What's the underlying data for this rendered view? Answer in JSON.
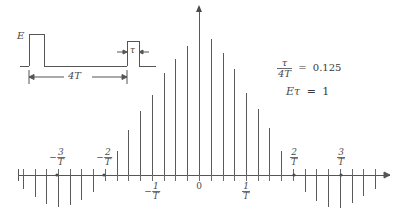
{
  "figure": {
    "axis_color": "#555555",
    "line_color": "#5a5a5a",
    "text_color": "#4a4a4a"
  },
  "pulse_diagram": {
    "amplitude_label": "E",
    "width_label": "τ",
    "period_label": "4T",
    "baseline_y": 66,
    "top_y": 34
  },
  "annotations": {
    "ratio": {
      "numerator": "τ",
      "denominator": "4T",
      "equals": "=",
      "value": "0.125"
    },
    "area": {
      "expr": "Eτ",
      "equals": "=",
      "value": "1"
    }
  },
  "axis": {
    "y": 175,
    "x_start": 18,
    "x_end": 392,
    "zero_x": 199,
    "line_spacing": 11.7,
    "tick_up": 6,
    "tick_down": 6,
    "labels": [
      {
        "text": "-3/T",
        "sign": "−",
        "num": "3",
        "den": "T",
        "x": 57,
        "y": 148,
        "marker": true
      },
      {
        "text": "-2/T",
        "sign": "−",
        "num": "2",
        "den": "T",
        "x": 104,
        "y": 148,
        "marker": true
      },
      {
        "text": "-1/T",
        "sign": "−",
        "num": "1",
        "den": "T",
        "x": 152,
        "y": 182,
        "marker": false
      },
      {
        "text": "0",
        "sign": "",
        "num": "0",
        "den": "",
        "x": 199,
        "y": 182,
        "marker": false
      },
      {
        "text": "1/T",
        "sign": "",
        "num": "1",
        "den": "T",
        "x": 246,
        "y": 182,
        "marker": false
      },
      {
        "text": "2/T",
        "sign": "",
        "num": "2",
        "den": "T",
        "x": 294,
        "y": 148,
        "marker": true
      },
      {
        "text": "3/T",
        "sign": "",
        "num": "3",
        "den": "T",
        "x": 341,
        "y": 148,
        "marker": true
      }
    ]
  },
  "chart_data": {
    "type": "line-spectrum",
    "xlabel": "frequency",
    "ylabel": "amplitude",
    "envelope": "sinc",
    "duty_cycle": 0.125,
    "pulse_area": 1,
    "harmonic_spacing": "1/(4T)",
    "xlim": [
      -4.2,
      4.2
    ],
    "ylim": [
      -0.28,
      1.05
    ],
    "x_unit": "1/T",
    "grid": false,
    "legend": false,
    "x": [
      -3.75,
      -3.5,
      -3.25,
      -3.0,
      -2.75,
      -2.5,
      -2.25,
      -2.0,
      -1.75,
      -1.5,
      -1.25,
      -1.0,
      -0.75,
      -0.5,
      -0.25,
      0,
      0.25,
      0.5,
      0.75,
      1.0,
      1.25,
      1.5,
      1.75,
      2.0,
      2.25,
      2.5,
      2.75,
      3.0,
      3.25,
      3.5,
      3.75
    ],
    "values": [
      -0.085,
      -0.13,
      -0.17,
      -0.185,
      -0.175,
      -0.145,
      -0.1,
      0.0,
      0.135,
      0.26,
      0.375,
      0.47,
      0.6,
      0.68,
      0.76,
      1.0,
      0.8,
      0.715,
      0.62,
      0.48,
      0.385,
      0.275,
      0.14,
      0.0,
      -0.1,
      -0.15,
      -0.185,
      -0.19,
      -0.165,
      -0.125,
      -0.085
    ],
    "series": [
      {
        "name": "harmonic amplitudes",
        "values": [
          -0.085,
          -0.13,
          -0.17,
          -0.185,
          -0.175,
          -0.145,
          -0.1,
          0.0,
          0.135,
          0.26,
          0.375,
          0.47,
          0.6,
          0.68,
          0.76,
          1.0,
          0.8,
          0.715,
          0.62,
          0.48,
          0.385,
          0.275,
          0.14,
          0.0,
          -0.1,
          -0.15,
          -0.185,
          -0.19,
          -0.165,
          -0.125,
          -0.085
        ]
      }
    ]
  },
  "spectrum_pixels": {
    "note": "x pixel, height in pixels above(+)/below(-) the axis for each spectral line",
    "lines": [
      {
        "x": 23,
        "h": -14
      },
      {
        "x": 35,
        "h": -22
      },
      {
        "x": 46,
        "h": -29
      },
      {
        "x": 58,
        "h": -32
      },
      {
        "x": 70,
        "h": -30
      },
      {
        "x": 81,
        "h": -25
      },
      {
        "x": 93,
        "h": -17
      },
      {
        "x": 105,
        "h": 0
      },
      {
        "x": 117,
        "h": 24
      },
      {
        "x": 128,
        "h": 45
      },
      {
        "x": 140,
        "h": 64
      },
      {
        "x": 152,
        "h": 80
      },
      {
        "x": 164,
        "h": 102
      },
      {
        "x": 175,
        "h": 116
      },
      {
        "x": 187,
        "h": 129
      },
      {
        "x": 199,
        "h": 168
      },
      {
        "x": 211,
        "h": 136
      },
      {
        "x": 223,
        "h": 122
      },
      {
        "x": 234,
        "h": 106
      },
      {
        "x": 246,
        "h": 82
      },
      {
        "x": 258,
        "h": 66
      },
      {
        "x": 269,
        "h": 47
      },
      {
        "x": 281,
        "h": 24
      },
      {
        "x": 293,
        "h": 0
      },
      {
        "x": 305,
        "h": -17
      },
      {
        "x": 316,
        "h": -26
      },
      {
        "x": 328,
        "h": -32
      },
      {
        "x": 340,
        "h": -33
      },
      {
        "x": 352,
        "h": -28
      },
      {
        "x": 363,
        "h": -21
      },
      {
        "x": 375,
        "h": -14
      }
    ]
  }
}
